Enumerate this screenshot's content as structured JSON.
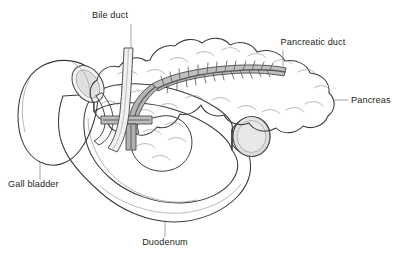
{
  "figure": {
    "type": "anatomical-illustration",
    "width": 398,
    "height": 261,
    "background_color": "#ffffff",
    "style": "black and white line drawing with grey tonal shading"
  },
  "palette": {
    "outline": "#3a3a3c",
    "fine_line": "#8b8b8d",
    "leader_line": "#8d8d8f",
    "text": "#231f20",
    "duodenum_fill": "#efefef",
    "duodenum_shadow": "#dcdcdc",
    "gallbladder_fill": "#ededed",
    "gallbladder_shadow": "#d9d9d9",
    "pancreas_fill": "#fbfbfb",
    "duct_fill": "#b9b9b9",
    "duct_dark": "#8f8f91",
    "lumen_fill": "#e4e4e4"
  },
  "labels": [
    {
      "id": "bile-duct",
      "text": "Bile duct",
      "text_x": 110,
      "text_y": 18,
      "anchor": "middle",
      "leader": "M 131 24 L 131 48"
    },
    {
      "id": "pancreatic-duct",
      "text": "Pancreatic duct",
      "text_x": 313,
      "text_y": 45,
      "anchor": "middle",
      "leader": "M 283 50 L 283 68"
    },
    {
      "id": "pancreas",
      "text": "Pancreas",
      "text_x": 351,
      "text_y": 103,
      "anchor": "start",
      "leader": "M 333 100 L 348 100"
    },
    {
      "id": "gall-bladder",
      "text": "Gall bladder",
      "text_x": 8,
      "text_y": 187,
      "anchor": "start",
      "leader": "M 40 162 L 40 180"
    },
    {
      "id": "duodenum",
      "text": "Duodenum",
      "text_x": 165,
      "text_y": 245,
      "anchor": "middle",
      "leader": "M 165 220 L 165 237"
    }
  ],
  "structures": [
    {
      "id": "pancreas",
      "name": "Pancreas",
      "description": "lobulated gland extending from head at left to tail at right"
    },
    {
      "id": "pancreatic-duct",
      "name": "Pancreatic duct",
      "description": "central duct with feather-like side branches running the length of the gland"
    },
    {
      "id": "bile-duct",
      "name": "Bile duct",
      "description": "tube descending from above through the pancreas head"
    },
    {
      "id": "gall-bladder",
      "name": "Gall bladder",
      "description": "pear-shaped sac at lower left with neck opening upward"
    },
    {
      "id": "duodenum",
      "name": "Duodenum",
      "description": "C-shaped segment of small intestine cradling the pancreas head, cut open at right"
    }
  ]
}
